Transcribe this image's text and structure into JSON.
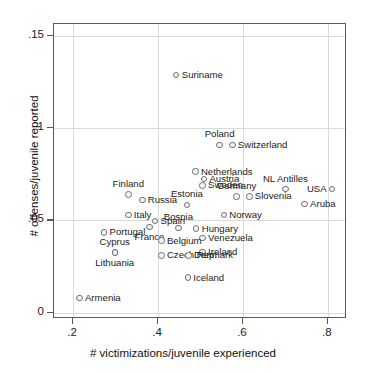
{
  "chart_data": {
    "type": "scatter",
    "title": "",
    "xlabel": "# victimizations/juvenile experienced",
    "ylabel": "# offenses/juvenile reported",
    "xlim": [
      0.155,
      0.845
    ],
    "ylim": [
      -0.0035,
      0.1565
    ],
    "xticks": [
      0.2,
      0.4,
      0.6,
      0.8
    ],
    "xticklabels": [
      ".2",
      ".4",
      ".6",
      ".8"
    ],
    "yticks": [
      0,
      0.05,
      0.1,
      0.15
    ],
    "yticklabels": [
      "0",
      ".05",
      ".1",
      ".15"
    ],
    "grid": true,
    "legend": null,
    "marker_color": "#6f7478",
    "marker_fill": "#f2f3f4",
    "points": [
      {
        "label": "Suriname",
        "x": 0.443,
        "y": 0.129,
        "pos": "r"
      },
      {
        "label": "Poland",
        "x": 0.545,
        "y": 0.091,
        "pos": "t"
      },
      {
        "label": "Switzerland",
        "x": 0.575,
        "y": 0.091,
        "pos": "r"
      },
      {
        "label": "Netherlands",
        "x": 0.488,
        "y": 0.0765,
        "pos": "r"
      },
      {
        "label": "Austria",
        "x": 0.508,
        "y": 0.0725,
        "pos": "r"
      },
      {
        "label": "Sweden",
        "x": 0.505,
        "y": 0.069,
        "pos": "r"
      },
      {
        "label": "NL Antilles",
        "x": 0.7,
        "y": 0.067,
        "pos": "t"
      },
      {
        "label": "USA",
        "x": 0.81,
        "y": 0.067,
        "pos": "l"
      },
      {
        "label": "Finland",
        "x": 0.33,
        "y": 0.064,
        "pos": "t"
      },
      {
        "label": "Germany",
        "x": 0.585,
        "y": 0.063,
        "pos": "t"
      },
      {
        "label": "Slovenia",
        "x": 0.615,
        "y": 0.063,
        "pos": "r"
      },
      {
        "label": "Russia",
        "x": 0.363,
        "y": 0.061,
        "pos": "r"
      },
      {
        "label": "Estonia",
        "x": 0.468,
        "y": 0.0585,
        "pos": "t"
      },
      {
        "label": "Aruba",
        "x": 0.745,
        "y": 0.059,
        "pos": "r"
      },
      {
        "label": "Italy",
        "x": 0.33,
        "y": 0.053,
        "pos": "r"
      },
      {
        "label": "Norway",
        "x": 0.555,
        "y": 0.053,
        "pos": "r"
      },
      {
        "label": "Spain",
        "x": 0.393,
        "y": 0.0495,
        "pos": "r"
      },
      {
        "label": "Bosnia",
        "x": 0.448,
        "y": 0.046,
        "pos": "t"
      },
      {
        "label": "Hungary",
        "x": 0.49,
        "y": 0.0455,
        "pos": "r"
      },
      {
        "label": "France",
        "x": 0.38,
        "y": 0.0465,
        "pos": "b"
      },
      {
        "label": "Portugal",
        "x": 0.273,
        "y": 0.0435,
        "pos": "r"
      },
      {
        "label": "Venezuela",
        "x": 0.505,
        "y": 0.0405,
        "pos": "r"
      },
      {
        "label": "Belgium",
        "x": 0.408,
        "y": 0.039,
        "pos": "r"
      },
      {
        "label": "Cyprus",
        "x": 0.298,
        "y": 0.0325,
        "pos": "t"
      },
      {
        "label": "Ireland",
        "x": 0.505,
        "y": 0.033,
        "pos": "r"
      },
      {
        "label": "Czech Rep.",
        "x": 0.408,
        "y": 0.031,
        "pos": "r"
      },
      {
        "label": "Denmark",
        "x": 0.472,
        "y": 0.031,
        "pos": "r"
      },
      {
        "label": "Lithuania",
        "x": 0.298,
        "y": 0.0325,
        "pos": "b"
      },
      {
        "label": "Iceland",
        "x": 0.47,
        "y": 0.019,
        "pos": "r"
      },
      {
        "label": "Armenia",
        "x": 0.215,
        "y": 0.008,
        "pos": "r"
      }
    ]
  }
}
